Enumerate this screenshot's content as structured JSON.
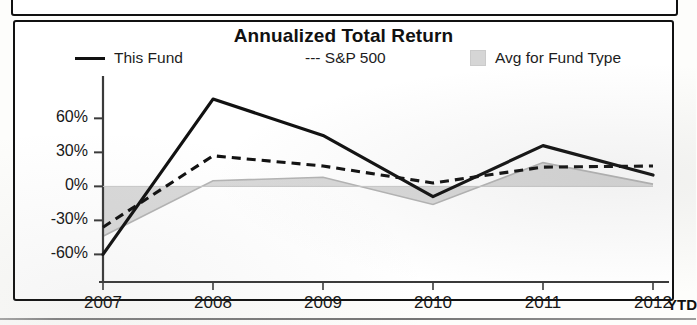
{
  "panel": {
    "title": "Annualized Total Return"
  },
  "legend": {
    "items": [
      {
        "label": "This Fund",
        "marker": "solid-line-swatch"
      },
      {
        "label": "--- S&P 500",
        "marker": "dashed-line-swatch"
      },
      {
        "label": "Avg for Fund Type",
        "marker": "shaded-area-swatch"
      }
    ]
  },
  "axis": {
    "y_ticks": [
      "60%",
      "30%",
      "0%",
      "-30%",
      "-60%"
    ],
    "x_ticks": [
      "2007",
      "2008",
      "2009",
      "2010",
      "2011",
      "2012"
    ],
    "x_suffix": "YTD"
  },
  "colors": {
    "line": "#111111",
    "area_fill": "#d2d2d2",
    "area_stroke": "#b4b4b4",
    "axis": "#3a3a3a",
    "panel_border": "#111111",
    "background": "#ffffff"
  },
  "chart_data": {
    "type": "line",
    "title": "Annualized Total Return",
    "xlabel": "",
    "ylabel": "",
    "categories": [
      "2007",
      "2008",
      "2009",
      "2010",
      "2011",
      "2012"
    ],
    "x_axis_note": "2012 column is year-to-date (YTD)",
    "ylim": [
      -72,
      85
    ],
    "y_ticks": [
      60,
      30,
      0,
      -30,
      -60
    ],
    "y_unit": "percent",
    "grid": false,
    "legend_position": "top",
    "series": [
      {
        "name": "This Fund",
        "style": "solid",
        "values": [
          -60,
          77,
          45,
          -9,
          36,
          10
        ]
      },
      {
        "name": "S&P 500",
        "style": "dashed",
        "values": [
          -36,
          27,
          18,
          3,
          17,
          18
        ]
      },
      {
        "name": "Avg for Fund Type",
        "style": "area",
        "values": [
          -44,
          5,
          8,
          -16,
          21,
          2
        ]
      }
    ]
  }
}
